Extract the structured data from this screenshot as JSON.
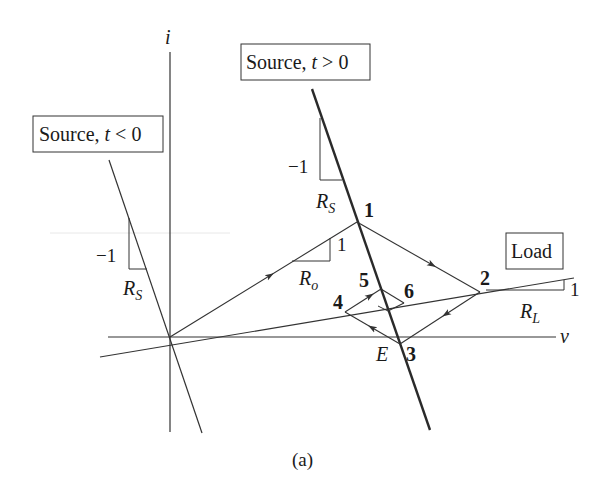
{
  "axes": {
    "vertical_label": "i",
    "horizontal_label": "v"
  },
  "boxes": {
    "source_before": "Source, t < 0",
    "source_before_prefix": "Source, ",
    "source_before_var": "t",
    "source_before_rel": " < 0",
    "source_after_prefix": "Source, ",
    "source_after_var": "t",
    "source_after_rel": " > 0",
    "load": "Load"
  },
  "slopes": {
    "source_before": {
      "rise": "−1",
      "run_main": "R",
      "run_sub": "S"
    },
    "source_after": {
      "rise": "−1",
      "run_main": "R",
      "run_sub": "S"
    },
    "ro": {
      "rise": "1",
      "run_main": "R",
      "run_sub": "o"
    },
    "load": {
      "rise": "1",
      "run_main": "R",
      "run_sub": "L"
    }
  },
  "points": {
    "p1": "1",
    "p2": "2",
    "p3": "3",
    "p4": "4",
    "p5": "5",
    "p6": "6",
    "e": "E"
  },
  "caption": "(a)"
}
